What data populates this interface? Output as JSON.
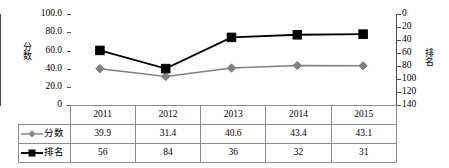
{
  "chart_data": {
    "type": "line",
    "title": "",
    "categories": [
      "2011",
      "2012",
      "2013",
      "2014",
      "2015"
    ],
    "series": [
      {
        "name": "分数",
        "values": [
          39.9,
          31.4,
          40.6,
          43.4,
          43.1
        ],
        "axis": "left",
        "color": "#808080",
        "marker": "diamond"
      },
      {
        "name": "排名",
        "values": [
          56,
          84,
          36,
          32,
          31
        ],
        "axis": "right",
        "color": "#000000",
        "marker": "square"
      }
    ],
    "axes": {
      "left": {
        "label": "分数",
        "ticks": [
          "0",
          "20.0",
          "40.0",
          "60.0",
          "80.0",
          "100.0"
        ],
        "min": 0,
        "max": 100,
        "inverted": false
      },
      "right": {
        "label": "排名",
        "ticks": [
          "0",
          "20",
          "40",
          "60",
          "80",
          "100",
          "120",
          "140"
        ],
        "min": 0,
        "max": 140,
        "inverted": true
      },
      "x": {
        "label": "",
        "ticks": [
          "2011",
          "2012",
          "2013",
          "2014",
          "2015"
        ]
      }
    },
    "grid": false,
    "legend_position": "data-table-left-column"
  },
  "table": {
    "header": [
      "",
      "2011",
      "2012",
      "2013",
      "2014",
      "2015"
    ],
    "rows": [
      {
        "label": "分数",
        "marker": "diamond",
        "color": "#808080",
        "values": [
          "39.9",
          "31.4",
          "40.6",
          "43.4",
          "43.1"
        ]
      },
      {
        "label": "排名",
        "marker": "square",
        "color": "#000000",
        "values": [
          "56",
          "84",
          "36",
          "32",
          "31"
        ]
      }
    ]
  },
  "ticks": {
    "left": [
      {
        "text": "100.0",
        "y": 14
      },
      {
        "text": "80.0",
        "y": 32
      },
      {
        "text": "60.0",
        "y": 51
      },
      {
        "text": "40.0",
        "y": 69
      },
      {
        "text": "20.0",
        "y": 87
      },
      {
        "text": "0",
        "y": 105
      }
    ],
    "right": [
      {
        "text": "0",
        "y": 14
      },
      {
        "text": "20",
        "y": 27
      },
      {
        "text": "40",
        "y": 40
      },
      {
        "text": "60",
        "y": 53
      },
      {
        "text": "80",
        "y": 66
      },
      {
        "text": "100",
        "y": 79
      },
      {
        "text": "120",
        "y": 92
      },
      {
        "text": "140",
        "y": 105
      }
    ]
  },
  "axis_titles": {
    "left": "分数",
    "right": "排名"
  }
}
